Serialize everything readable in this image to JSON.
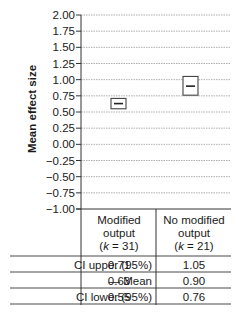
{
  "chart_data": {
    "type": "box",
    "title": "",
    "xlabel": "",
    "ylabel": "Mean effect size",
    "ylim": [
      -1.0,
      2.0
    ],
    "yticks": [
      "2.00",
      "1.75",
      "1.50",
      "1.25",
      "1.00",
      "0.75",
      "0.50",
      "0.25",
      "0.00",
      "−0.25",
      "−0.50",
      "−0.75",
      "−1.00"
    ],
    "grid": true,
    "categories": [
      {
        "line1": "Modified",
        "line2": "output",
        "k_label": "k",
        "k_value": "31"
      },
      {
        "line1": "No modified",
        "line2": "output",
        "k_label": "k",
        "k_value": "21"
      }
    ],
    "series": [
      {
        "name": "CI upper (95%)",
        "values": [
          0.71,
          1.05
        ]
      },
      {
        "name": "Mean",
        "values": [
          0.63,
          0.9
        ]
      },
      {
        "name": "CI lower (95%)",
        "values": [
          0.55,
          0.76
        ]
      }
    ]
  },
  "table": {
    "rows": [
      {
        "label": "CI upper (95%)",
        "values": [
          "0.71",
          "1.05"
        ]
      },
      {
        "label": "— Mean",
        "values": [
          "0.63",
          "0.90"
        ]
      },
      {
        "label": "CI lower (95%)",
        "values": [
          "0.55",
          "0.76"
        ]
      }
    ]
  }
}
